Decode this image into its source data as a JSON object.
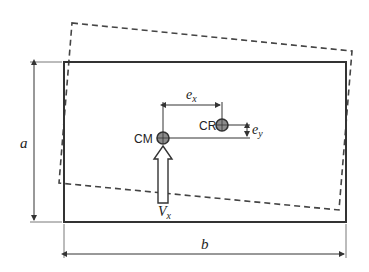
{
  "diagram": {
    "labels": {
      "a": "a",
      "b": "b",
      "cm": "CM",
      "cr": "CR",
      "ex_base": "e",
      "ex_sub": "x",
      "ey_base": "e",
      "ey_sub": "y",
      "vx_base": "V",
      "vx_sub": "x"
    },
    "colors": {
      "line": "#333333",
      "dashed": "#444444",
      "point_fill": "#8c8c8c",
      "background": "#ffffff"
    },
    "elements": [
      "original plan rectangle (solid)",
      "rotated plan rectangle (dashed)",
      "dimension a (height)",
      "dimension b (width)",
      "center of mass CM",
      "center of rigidity CR",
      "eccentricity e_x",
      "eccentricity e_y",
      "shear force V_x (hollow arrow)"
    ]
  }
}
